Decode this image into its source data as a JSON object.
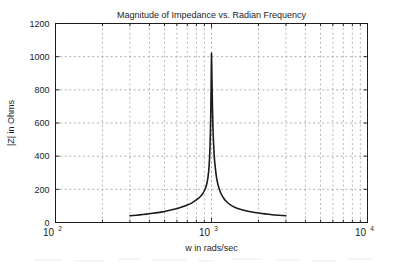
{
  "figure": {
    "background_color": "#ffffff",
    "axes_color": "#1c1c1c",
    "grid_color": "#9a9a9a",
    "line_color": "#1a1a1a"
  },
  "chart_data": {
    "type": "line",
    "title": "Magnitude of Impedance vs. Radian Frequency",
    "xlabel": "w in rads/sec",
    "ylabel": "|Z| in Ohms",
    "xscale": "log",
    "yscale": "linear",
    "xlim": [
      100,
      10000
    ],
    "ylim": [
      0,
      1200
    ],
    "grid": true,
    "legend": null,
    "xticks": [
      100,
      1000,
      10000
    ],
    "xtick_labels": [
      "10^2",
      "10^3",
      "10^4"
    ],
    "xtick_label_parts": [
      {
        "base": "10",
        "exp": "2"
      },
      {
        "base": "10",
        "exp": "3"
      },
      {
        "base": "10",
        "exp": "4"
      }
    ],
    "yticks": [
      0,
      200,
      400,
      600,
      800,
      1000,
      1200
    ],
    "ytick_labels": [
      "0",
      "200",
      "400",
      "600",
      "800",
      "1000",
      "1200"
    ],
    "series": [
      {
        "name": "|Z|",
        "resonance_omega": 1000,
        "peak_value": 1020,
        "x_range": [
          300,
          3000
        ],
        "x": [
          300,
          330,
          363,
          400,
          440,
          484,
          532,
          586,
          645,
          700,
          750,
          800,
          840,
          875,
          905,
          930,
          950,
          965,
          978,
          988,
          995,
          1000,
          1006,
          1014,
          1024,
          1038,
          1055,
          1080,
          1110,
          1150,
          1200,
          1260,
          1330,
          1420,
          1530,
          1660,
          1820,
          2000,
          2200,
          2450,
          2700,
          3000
        ],
        "y": [
          41,
          44,
          48,
          53,
          58,
          64,
          72,
          81,
          93,
          105,
          118,
          136,
          152,
          172,
          196,
          228,
          275,
          340,
          450,
          620,
          830,
          1020,
          880,
          700,
          540,
          420,
          340,
          265,
          215,
          175,
          145,
          122,
          105,
          91,
          80,
          71,
          63,
          57,
          52,
          47,
          44,
          41
        ]
      }
    ]
  }
}
